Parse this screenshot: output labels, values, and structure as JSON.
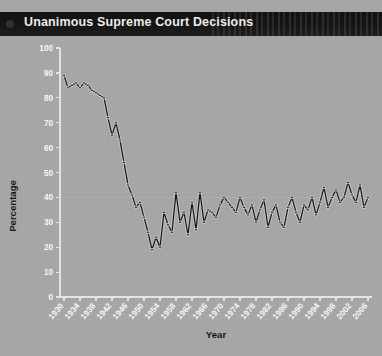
{
  "titlebar": {
    "title": "Unanimous Supreme Court Decisions"
  },
  "chart_data": {
    "type": "line",
    "title": "Unanimous Supreme Court Decisions",
    "xlabel": "Year",
    "ylabel": "Percentage",
    "xlim": [
      1929,
      2007
    ],
    "ylim": [
      0,
      100
    ],
    "grid": false,
    "legend": "none",
    "ytick_labels": [
      "0",
      "10",
      "20",
      "30",
      "40",
      "50",
      "60",
      "70",
      "80",
      "90",
      "100"
    ],
    "yticks": [
      0,
      10,
      20,
      30,
      40,
      50,
      60,
      70,
      80,
      90,
      100
    ],
    "xtick_labels": [
      "1930",
      "1934",
      "1938",
      "1942",
      "1946",
      "1950",
      "1954",
      "1958",
      "1962",
      "1966",
      "1970",
      "1974",
      "1978",
      "1982",
      "1986",
      "1990",
      "1994",
      "1998",
      "2002",
      "2006"
    ],
    "xticks": [
      1930,
      1934,
      1938,
      1942,
      1946,
      1950,
      1954,
      1958,
      1962,
      1966,
      1970,
      1974,
      1978,
      1982,
      1986,
      1990,
      1994,
      1998,
      2002,
      2006
    ],
    "series": [
      {
        "name": "Unanimous decisions",
        "x": [
          1930,
          1931,
          1932,
          1933,
          1934,
          1935,
          1936,
          1937,
          1938,
          1939,
          1940,
          1941,
          1942,
          1943,
          1944,
          1945,
          1946,
          1947,
          1948,
          1949,
          1950,
          1951,
          1952,
          1953,
          1954,
          1955,
          1956,
          1957,
          1958,
          1959,
          1960,
          1961,
          1962,
          1963,
          1964,
          1965,
          1966,
          1967,
          1968,
          1969,
          1970,
          1971,
          1972,
          1973,
          1974,
          1975,
          1976,
          1977,
          1978,
          1979,
          1980,
          1981,
          1982,
          1983,
          1984,
          1985,
          1986,
          1987,
          1988,
          1989,
          1990,
          1991,
          1992,
          1993,
          1994,
          1995,
          1996,
          1997,
          1998,
          1999,
          2000,
          2001,
          2002,
          2003,
          2004,
          2005,
          2006
        ],
        "values": [
          89,
          84,
          85,
          86,
          84,
          86,
          85,
          83,
          82,
          81,
          80,
          72,
          65,
          70,
          63,
          54,
          45,
          41,
          36,
          38,
          32,
          26,
          19,
          24,
          20,
          34,
          29,
          26,
          42,
          30,
          34,
          25,
          38,
          27,
          42,
          30,
          35,
          34,
          32,
          37,
          40,
          38,
          36,
          34,
          40,
          36,
          33,
          37,
          30,
          35,
          39,
          28,
          34,
          37,
          30,
          28,
          36,
          40,
          34,
          30,
          37,
          35,
          40,
          33,
          38,
          44,
          36,
          40,
          43,
          38,
          40,
          46,
          41,
          38,
          45,
          36,
          40
        ]
      }
    ]
  }
}
